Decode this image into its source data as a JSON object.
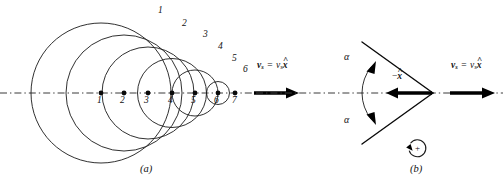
{
  "figure": {
    "background_color": "#ffffff",
    "ink_color": "#111111",
    "panels": [
      {
        "id": "a",
        "label": "(a)",
        "label_x": 141,
        "label_y": 170
      },
      {
        "id": "b",
        "label": "(b)",
        "label_x": 411,
        "label_y": 170
      }
    ]
  },
  "panel_a": {
    "description": "Expanding spherical wavefronts emitted by a supersonic source at successive positions",
    "axis": {
      "y": 93,
      "x_start": 0,
      "x_end": 262,
      "style": "dash-dot"
    },
    "source_positions": [
      {
        "label": "1",
        "x": 101,
        "y": 93,
        "radius": 70
      },
      {
        "label": "2",
        "x": 124,
        "y": 93,
        "radius": 58
      },
      {
        "label": "3",
        "x": 148,
        "y": 93,
        "radius": 46
      },
      {
        "label": "4",
        "x": 172,
        "y": 93,
        "radius": 34.5
      },
      {
        "label": "5",
        "x": 195,
        "y": 93,
        "radius": 23
      },
      {
        "label": "6",
        "x": 218,
        "y": 93,
        "radius": 11.5
      },
      {
        "label": "7",
        "x": 235,
        "y": 93,
        "radius": 0
      }
    ],
    "wavefront_labels": [
      {
        "label": "1",
        "x": 160,
        "y": 11
      },
      {
        "label": "2",
        "x": 184,
        "y": 24
      },
      {
        "label": "3",
        "x": 205,
        "y": 35
      },
      {
        "label": "4",
        "x": 220,
        "y": 47
      },
      {
        "label": "5",
        "x": 234,
        "y": 59
      },
      {
        "label": "6",
        "x": 245,
        "y": 70
      }
    ],
    "velocity_vector": {
      "label_bold": "v",
      "label_sub": "s",
      "equals": " = ",
      "scalar": "v",
      "scalar_sub": "s",
      "unit_vector": "x",
      "label_x": 258,
      "label_y": 64,
      "arrow_x_start": 254,
      "arrow_x_end": 296,
      "arrow_y": 93
    }
  },
  "panel_b": {
    "description": "Mach cone with half angle alpha and backward unit vector",
    "axis": {
      "y": 93,
      "x_start": 256,
      "x_end": 503,
      "style": "dash-dot"
    },
    "cone": {
      "apex_x": 433,
      "apex_y": 93,
      "upper_end_x": 362,
      "upper_end_y": 42,
      "lower_end_x": 362,
      "lower_end_y": 144
    },
    "angle_labels": [
      {
        "label": "α",
        "x": 347,
        "y": 57
      },
      {
        "label": "α",
        "x": 347,
        "y": 120
      }
    ],
    "unit_vector_label": {
      "sign": "−",
      "unit_vector": "x",
      "x": 395,
      "y": 76
    },
    "back_arrow": {
      "x_start": 430,
      "x_end": 388,
      "y": 93
    },
    "velocity_vector": {
      "label_bold": "v",
      "label_sub": "s",
      "equals": " = ",
      "scalar": "v",
      "scalar_sub": "s",
      "unit_vector": "x",
      "label_x": 452,
      "label_y": 64,
      "arrow_x_start": 450,
      "arrow_x_end": 492,
      "arrow_y": 93
    },
    "sense_indicator": {
      "label": "+",
      "center_x": 417,
      "center_y": 149,
      "radius": 8.5,
      "direction": "counterclockwise"
    }
  }
}
